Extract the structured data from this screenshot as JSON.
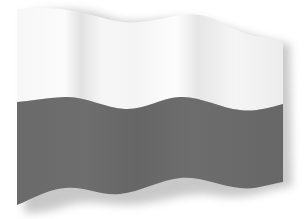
{
  "image": {
    "subject": "waving bicolor flag",
    "stripes": [
      {
        "position": "top",
        "color": "#f4f4f4"
      },
      {
        "position": "bottom",
        "color": "#6b6b6b"
      }
    ],
    "background": "#ffffff",
    "shadow_color": "#c8c8c8"
  }
}
